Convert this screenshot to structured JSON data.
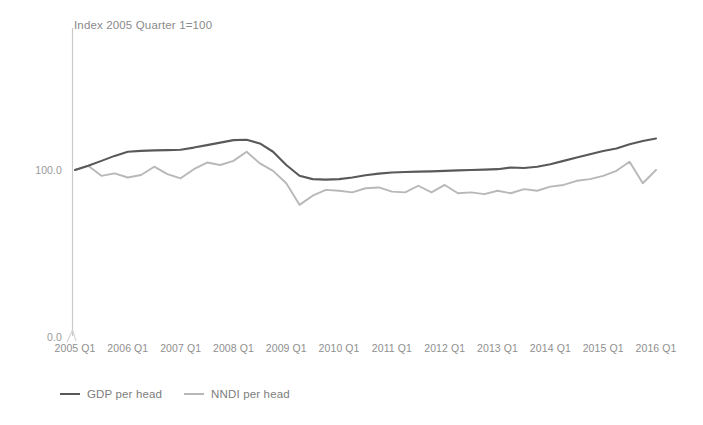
{
  "chart_data": {
    "type": "line",
    "title": "",
    "subtitle": "",
    "annotation": "Index 2005 Quarter 1=100",
    "xlabel": "",
    "ylabel": "",
    "ylim": [
      0,
      140
    ],
    "yticks": [
      "0.0",
      "100.0"
    ],
    "ytick_values": [
      0,
      100
    ],
    "grid": false,
    "legend_position": "bottom-left",
    "categories": [
      "2005 Q1",
      "2005 Q2",
      "2005 Q3",
      "2005 Q4",
      "2006 Q1",
      "2006 Q2",
      "2006 Q3",
      "2006 Q4",
      "2007 Q1",
      "2007 Q2",
      "2007 Q3",
      "2007 Q4",
      "2008 Q1",
      "2008 Q2",
      "2008 Q3",
      "2008 Q4",
      "2009 Q1",
      "2009 Q2",
      "2009 Q3",
      "2009 Q4",
      "2010 Q1",
      "2010 Q2",
      "2010 Q3",
      "2010 Q4",
      "2011 Q1",
      "2011 Q2",
      "2011 Q3",
      "2011 Q4",
      "2012 Q1",
      "2012 Q2",
      "2012 Q3",
      "2012 Q4",
      "2013 Q1",
      "2013 Q2",
      "2013 Q3",
      "2013 Q4",
      "2014 Q1",
      "2014 Q2",
      "2014 Q3",
      "2014 Q4",
      "2015 Q1",
      "2015 Q2",
      "2015 Q3",
      "2015 Q4",
      "2016 Q1"
    ],
    "xtick_labels": [
      "2005 Q1",
      "2006 Q1",
      "2007 Q1",
      "2008 Q1",
      "2009 Q1",
      "2010 Q1",
      "2011 Q1",
      "2012 Q1",
      "2013 Q1",
      "2014 Q1",
      "2015 Q1",
      "2016 Q1"
    ],
    "series": [
      {
        "name": "GDP per head",
        "color": "#595959",
        "values": [
          100.0,
          102.5,
          105.5,
          108.5,
          111.0,
          111.5,
          111.8,
          112.0,
          112.2,
          113.5,
          115.0,
          116.5,
          118.0,
          118.2,
          116.0,
          111.0,
          103.0,
          96.5,
          94.5,
          94.2,
          94.5,
          95.5,
          96.8,
          97.8,
          98.5,
          98.8,
          99.0,
          99.2,
          99.5,
          99.8,
          100.0,
          100.2,
          100.5,
          101.5,
          101.2,
          102.0,
          103.5,
          105.5,
          107.5,
          109.5,
          111.5,
          113.0,
          115.5,
          117.5,
          119.0
        ]
      },
      {
        "name": "NNDI per head",
        "color": "#b8b8b8",
        "values": [
          100.0,
          102.5,
          96.5,
          98.0,
          95.5,
          97.0,
          102.0,
          97.5,
          95.0,
          100.5,
          104.5,
          103.0,
          105.5,
          111.0,
          104.0,
          99.5,
          92.0,
          79.0,
          84.5,
          88.0,
          87.5,
          86.5,
          89.0,
          89.5,
          87.0,
          86.5,
          90.5,
          86.5,
          91.0,
          86.0,
          86.5,
          85.5,
          87.5,
          86.0,
          88.5,
          87.5,
          90.0,
          91.0,
          93.5,
          94.5,
          96.5,
          99.5,
          105.0,
          92.0,
          100.0
        ]
      }
    ]
  }
}
